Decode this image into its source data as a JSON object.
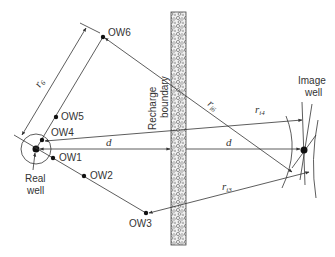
{
  "diagram": {
    "real_well": {
      "label_line1": "Real",
      "label_line2": "well",
      "x": 36,
      "y": 149
    },
    "image_well": {
      "label_line1": "Image",
      "label_line2": "well",
      "x": 304,
      "y": 150
    },
    "boundary": {
      "label_line1": "Recharge",
      "label_line2": "boundary"
    },
    "observation_wells": [
      {
        "id": "OW1",
        "label": "OW1",
        "x": 53,
        "y": 158
      },
      {
        "id": "OW2",
        "label": "OW2",
        "x": 84,
        "y": 176
      },
      {
        "id": "OW3",
        "label": "OW3",
        "x": 146,
        "y": 213
      },
      {
        "id": "OW4",
        "label": "OW4",
        "x": 42,
        "y": 140
      },
      {
        "id": "OW5",
        "label": "OW5",
        "x": 56,
        "y": 117
      },
      {
        "id": "OW6",
        "label": "OW6",
        "x": 103,
        "y": 37
      }
    ],
    "distances": {
      "d_left": "d",
      "d_right": "d",
      "r6": {
        "base": "r",
        "sub": "r6"
      },
      "ri6": {
        "base": "r",
        "sub": "i6"
      },
      "ri4": {
        "base": "r",
        "sub": "i4"
      },
      "ri3": {
        "base": "r",
        "sub": "i3"
      }
    },
    "colors": {
      "line": "#333333",
      "background": "#ffffff"
    }
  }
}
